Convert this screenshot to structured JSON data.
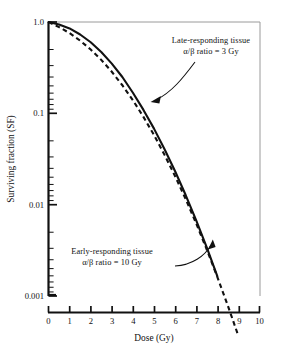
{
  "chart_data": {
    "type": "line",
    "title": "",
    "xlabel": "Dose (Gy)",
    "ylabel": "Surviving fraction (SF)",
    "xlim": [
      0,
      10
    ],
    "ylim": [
      0.001,
      1.0
    ],
    "yscale": "log",
    "xscale": "linear",
    "grid": false,
    "legend": "none (inline annotations with arrows)",
    "xticks": [
      "0",
      "1",
      "2",
      "3",
      "4",
      "5",
      "6",
      "7",
      "8",
      "9",
      "10"
    ],
    "yticks": [
      "1.0",
      "0.1",
      "0.01",
      "0.001"
    ],
    "y_minor_ticks": "log decades, 2-9 per decade",
    "series": [
      {
        "name": "Late-responding tissue",
        "alpha_beta_ratio_Gy": 3,
        "style": "solid",
        "color": "#111111",
        "x": [
          0,
          0.5,
          1,
          1.5,
          2,
          2.5,
          3,
          3.5,
          4,
          4.5,
          5,
          5.5,
          6,
          6.5,
          7,
          7.5,
          8
        ],
        "y": [
          1.0,
          0.94,
          0.85,
          0.73,
          0.6,
          0.47,
          0.35,
          0.25,
          0.168,
          0.109,
          0.068,
          0.0405,
          0.0232,
          0.01275,
          0.00672,
          0.0034,
          0.00165
        ]
      },
      {
        "name": "Early-responding tissue",
        "alpha_beta_ratio_Gy": 10,
        "style": "dashed",
        "color": "#111111",
        "x": [
          0,
          0.5,
          1,
          1.5,
          2,
          2.5,
          3,
          3.5,
          4,
          4.5,
          5,
          5.5,
          6,
          6.5,
          7,
          7.5,
          8,
          8.5,
          9
        ],
        "y": [
          1.0,
          0.88,
          0.755,
          0.625,
          0.5,
          0.385,
          0.285,
          0.203,
          0.139,
          0.0915,
          0.0578,
          0.0351,
          0.0205,
          0.01152,
          0.00622,
          0.00323,
          0.00162,
          0.000783,
          0.000365
        ]
      }
    ],
    "crossing_point": {
      "dose_Gy": 5.8,
      "surviving_fraction": 0.02
    },
    "annotations": [
      {
        "id": "late-responding",
        "line1": "Late-responding tissue",
        "line2": "α/β ratio = 3 Gy",
        "arrow_target": "solid curve"
      },
      {
        "id": "early-responding",
        "line1": "Early-responding tissue",
        "line2": "α/β ratio = 10 Gy",
        "arrow_target": "dashed curve"
      }
    ],
    "colors": {
      "axis": "#111111",
      "frame": "#8c8c8c",
      "curve": "#111111",
      "background": "#ffffff"
    }
  }
}
